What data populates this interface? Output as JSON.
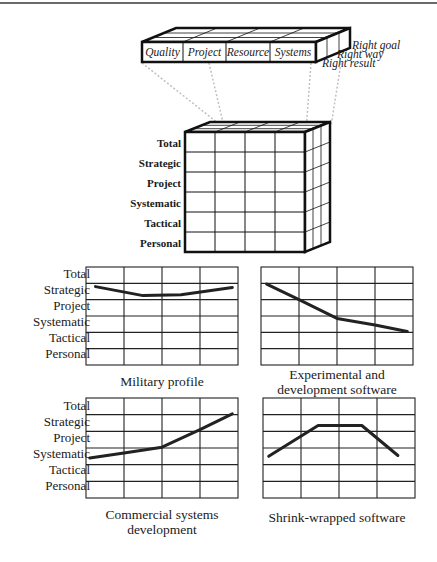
{
  "slab": {
    "columns": [
      "Quality",
      "Project",
      "Resource",
      "Systems"
    ],
    "depth_labels": [
      "Right goal",
      "Right way",
      "Right result"
    ]
  },
  "cube": {
    "rows": [
      "Total",
      "Strategic",
      "Project",
      "Systematic",
      "Tactical",
      "Personal"
    ]
  },
  "profiles": {
    "y_labels": [
      "Total",
      "Strategic",
      "Project",
      "Systematic",
      "Tactical",
      "Personal"
    ]
  },
  "chart_data": [
    {
      "type": "line",
      "title": "Military profile",
      "y_categories": [
        "Total",
        "Strategic",
        "Project",
        "Systematic",
        "Tactical",
        "Personal"
      ],
      "x": [
        0.25,
        1.5,
        2.5,
        3.85
      ],
      "y_level": [
        1.2,
        1.75,
        1.7,
        1.25
      ],
      "note": "y_level measured in row units from top (0=top of Total row, 6=bottom of Personal)"
    },
    {
      "type": "line",
      "title": "Experimental and development software",
      "y_categories": [
        "Total",
        "Strategic",
        "Project",
        "Systematic",
        "Tactical",
        "Personal"
      ],
      "x": [
        0.15,
        1.0,
        2.0,
        3.0,
        3.85
      ],
      "y_level": [
        1.05,
        2.0,
        3.15,
        3.55,
        3.95
      ]
    },
    {
      "type": "line",
      "title": "Commercial systems development",
      "y_categories": [
        "Total",
        "Strategic",
        "Project",
        "Systematic",
        "Tactical",
        "Personal"
      ],
      "x": [
        0.1,
        1.0,
        2.0,
        3.0,
        3.85
      ],
      "y_level": [
        3.6,
        3.3,
        2.95,
        1.9,
        0.95
      ]
    },
    {
      "type": "line",
      "title": "Shrink-wrapped software",
      "y_categories": [
        "Total",
        "Strategic",
        "Project",
        "Systematic",
        "Tactical",
        "Personal"
      ],
      "x": [
        0.15,
        1.45,
        2.6,
        3.55
      ],
      "y_level": [
        3.5,
        1.65,
        1.65,
        3.45
      ]
    }
  ],
  "captions": {
    "military": "Military profile",
    "experimental_line1": "Experimental and",
    "experimental_line2": "development software",
    "commercial_line1": "Commercial systems",
    "commercial_line2": "development",
    "shrink": "Shrink-wrapped software"
  }
}
